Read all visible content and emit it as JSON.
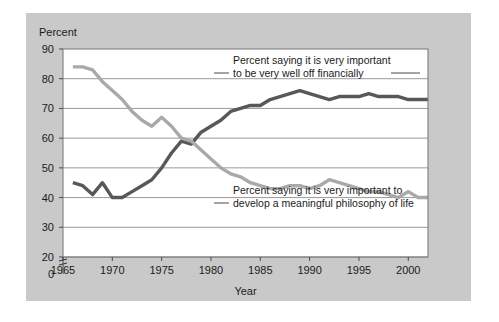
{
  "chart_data": {
    "type": "line",
    "title": "",
    "xlabel": "Year",
    "ylabel": "Percent",
    "xlim": [
      1965,
      2002
    ],
    "ylim": [
      20,
      90
    ],
    "y_axis_break": true,
    "y_break_label": "0",
    "grid": "horizontal",
    "legend": "annotations-on-plot",
    "xticks": [
      1965,
      1970,
      1975,
      1980,
      1985,
      1990,
      1995,
      2000
    ],
    "xtick_labels": [
      "1965",
      "1970",
      "1975",
      "1980",
      "1985",
      "1990",
      "1995",
      "2000"
    ],
    "yticks": [
      20,
      30,
      40,
      50,
      60,
      70,
      80,
      90
    ],
    "ytick_labels": [
      "20",
      "30",
      "40",
      "50",
      "60",
      "70",
      "80",
      "90"
    ],
    "x": [
      1966,
      1967,
      1968,
      1969,
      1970,
      1971,
      1972,
      1973,
      1974,
      1975,
      1976,
      1977,
      1978,
      1979,
      1980,
      1981,
      1982,
      1983,
      1984,
      1985,
      1986,
      1987,
      1988,
      1989,
      1990,
      1991,
      1992,
      1993,
      1994,
      1995,
      1996,
      1997,
      1998,
      1999,
      2000,
      2001,
      2002
    ],
    "series": [
      {
        "name": "Percent saying it is very important to be very well off financially",
        "color": "#58585a",
        "values": [
          45,
          44,
          41,
          45,
          40,
          40,
          42,
          44,
          46,
          50,
          55,
          59,
          58,
          62,
          64,
          66,
          69,
          70,
          71,
          71,
          73,
          74,
          75,
          76,
          75,
          74,
          73,
          74,
          74,
          74,
          75,
          74,
          74,
          74,
          73,
          73,
          73
        ]
      },
      {
        "name": "Percent saying it is very important to develop a meaningful philosophy of life",
        "color": "#a9a9ab",
        "values": [
          84,
          84,
          83,
          79,
          76,
          73,
          69,
          66,
          64,
          67,
          64,
          60,
          59,
          56,
          53,
          50,
          48,
          47,
          45,
          44,
          43,
          43,
          44,
          44,
          43,
          44,
          46,
          45,
          44,
          43,
          42,
          42,
          41,
          40,
          42,
          40,
          40
        ]
      }
    ],
    "annotations": [
      {
        "name": "financially-well-off-label",
        "lines": [
          "Percent saying it is very important",
          "to be very well off financially"
        ]
      },
      {
        "name": "philosophy-of-life-label",
        "lines": [
          "Percent saying it is very important to",
          "develop a meaningful philosophy of life"
        ]
      }
    ]
  }
}
